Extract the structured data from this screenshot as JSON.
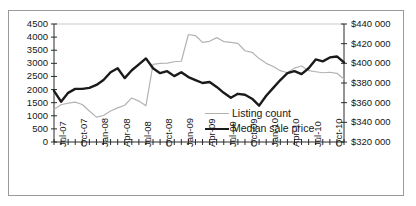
{
  "chart_data": {
    "type": "line",
    "title": "",
    "xlabel": "",
    "ylabel": "",
    "y2label": "",
    "grid": false,
    "legend_position": "center-right-inside",
    "x_tick_labels": [
      "Jul-07",
      "Oct-07",
      "Jan-08",
      "Apr-08",
      "Jul-08",
      "Oct-08",
      "Jan-09",
      "Apr-09",
      "Jul-09",
      "Oct-09",
      "Jan-10",
      "Apr-10",
      "Jul-10",
      "Oct-10"
    ],
    "x_tick_interval_months": 3,
    "x": [
      "Jul-07",
      "Aug-07",
      "Sep-07",
      "Oct-07",
      "Nov-07",
      "Dec-07",
      "Jan-08",
      "Feb-08",
      "Mar-08",
      "Apr-08",
      "May-08",
      "Jun-08",
      "Jul-08",
      "Aug-08",
      "Sep-08",
      "Oct-08",
      "Nov-08",
      "Dec-08",
      "Jan-09",
      "Feb-09",
      "Mar-09",
      "Apr-09",
      "May-09",
      "Jun-09",
      "Jul-09",
      "Aug-09",
      "Sep-09",
      "Oct-09",
      "Nov-09",
      "Dec-09",
      "Jan-10",
      "Feb-10",
      "Mar-10",
      "Apr-10",
      "May-10",
      "Jun-10",
      "Jul-10",
      "Aug-10",
      "Sep-10",
      "Oct-10",
      "Nov-10",
      "Dec-10"
    ],
    "ylim": [
      0,
      4500
    ],
    "yticks": [
      0,
      500,
      1000,
      1500,
      2000,
      2500,
      3000,
      3500,
      4000,
      4500
    ],
    "ytick_labels": [
      "0",
      "500",
      "1000",
      "1500",
      "2000",
      "2500",
      "3000",
      "3500",
      "4000",
      "4500"
    ],
    "y2lim": [
      320000,
      440000
    ],
    "y2ticks": [
      320000,
      340000,
      360000,
      380000,
      400000,
      420000,
      440000
    ],
    "y2tick_labels": [
      "$320 000",
      "$340 000",
      "$360 000",
      "$380 000",
      "$400 000",
      "$420 000",
      "$440 000"
    ],
    "series": [
      {
        "name": "Listing count",
        "axis": "left",
        "color": "#b3b3b3",
        "width": 1.2,
        "values": [
          1250,
          1420,
          1480,
          1520,
          1430,
          1180,
          950,
          1010,
          1180,
          1300,
          1400,
          1680,
          1560,
          1380,
          2960,
          3000,
          3010,
          3060,
          3080,
          4100,
          4060,
          3800,
          3840,
          3980,
          3830,
          3800,
          3760,
          3480,
          3420,
          3180,
          3000,
          2880,
          2720,
          2640,
          2820,
          2900,
          2720,
          2680,
          2640,
          2660,
          2620,
          2400
        ]
      },
      {
        "name": "Median sale price",
        "axis": "right",
        "color": "#1a1a1a",
        "width": 2.4,
        "values": [
          372000,
          361000,
          370000,
          374000,
          374000,
          375000,
          378000,
          383000,
          391000,
          395000,
          385000,
          393000,
          399000,
          405000,
          395000,
          390000,
          392000,
          387000,
          391000,
          386000,
          383000,
          380000,
          381000,
          376000,
          370000,
          365000,
          369000,
          368000,
          364000,
          357000,
          367000,
          375000,
          383000,
          390000,
          392000,
          389000,
          395000,
          404000,
          402000,
          406000,
          407000,
          401000
        ]
      }
    ]
  },
  "legend": {
    "items": [
      {
        "label": "Listing count"
      },
      {
        "label": "Median sale price"
      }
    ]
  }
}
